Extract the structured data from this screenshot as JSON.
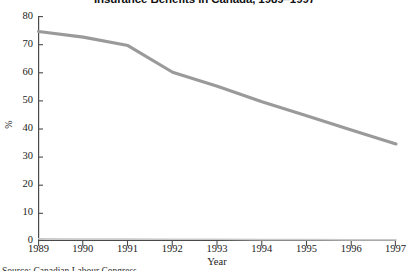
{
  "chart_data": {
    "type": "line",
    "title": "Insurance Benefits in Canada, 1989–1997",
    "xlabel": "Year",
    "ylabel": "%",
    "x": [
      1989,
      1990,
      1991,
      1992,
      1993,
      1994,
      1995,
      1996,
      1997
    ],
    "categories": [
      "1989",
      "1990",
      "1991",
      "1992",
      "1993",
      "1994",
      "1995",
      "1996",
      "1997"
    ],
    "xlim": [
      1989,
      1997
    ],
    "ylim": [
      0,
      80
    ],
    "grid": false,
    "legend": "none",
    "y_ticks": [
      0,
      10,
      20,
      30,
      40,
      50,
      60,
      70,
      80
    ],
    "y_tick_labels": [
      "0",
      "10",
      "20",
      "30",
      "40",
      "50",
      "60",
      "70",
      "80"
    ],
    "series": [
      {
        "name": "Unemployed receiving insurance benefits",
        "color": "#9a9a9a",
        "values": [
          74.5,
          72.5,
          69.5,
          60.0,
          55.0,
          49.5,
          44.5,
          39.5,
          34.5
        ]
      },
      {
        "name": "Baseline",
        "color": "#c9c9c9",
        "values": [
          0.8,
          0.7,
          0.7,
          0.6,
          0.6,
          0.5,
          0.5,
          0.4,
          0.4
        ]
      }
    ]
  },
  "source": {
    "note": "Source: Canadian Labour Congress"
  },
  "colors": {
    "axis": "#4a4a4a",
    "text": "#1a1a1a",
    "line_primary": "#9a9a9a",
    "line_secondary": "#c9c9c9",
    "background": "#ffffff"
  }
}
